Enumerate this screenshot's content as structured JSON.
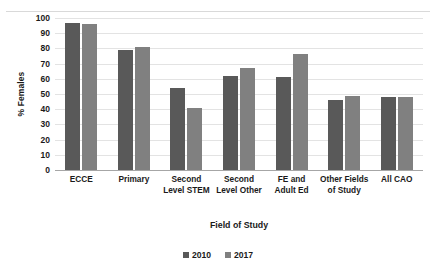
{
  "chart_data": {
    "type": "bar",
    "title": "",
    "xlabel": "Field of Study",
    "ylabel": "% Females",
    "ylim": [
      0,
      100
    ],
    "ytick_step": 10,
    "yticks": [
      100,
      90,
      80,
      70,
      60,
      50,
      40,
      30,
      20,
      10,
      0
    ],
    "grid": true,
    "legend_position": "bottom",
    "categories": [
      "ECCE",
      "Primary",
      "Second Level STEM",
      "Second Level Other",
      "FE and Adult Ed",
      "Other Fields of Study",
      "All CAO"
    ],
    "series": [
      {
        "name": "2010",
        "color": "#595959",
        "values": [
          97,
          79,
          54,
          62,
          61,
          46,
          48
        ]
      },
      {
        "name": "2017",
        "color": "#808080",
        "values": [
          96,
          81,
          41,
          67,
          76,
          49,
          48
        ]
      }
    ]
  },
  "axis": {
    "y_title": "% Females",
    "x_title": "Field of Study"
  },
  "colors": {
    "series_2010": "#595959",
    "series_2017": "#808080",
    "gridline": "#e3e3e3",
    "axis_line": "#a6a6a6",
    "background": "#ffffff",
    "text": "#1a1a1a"
  }
}
